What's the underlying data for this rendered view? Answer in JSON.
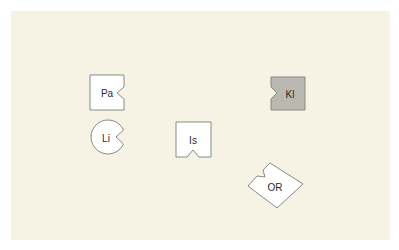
{
  "colors": {
    "background": "#f6f2e4",
    "shape_fill_default": "#ffffff",
    "shape_fill_highlight": "#b9b9b1",
    "stroke": "#8a8a84"
  },
  "shapes": [
    {
      "id": "pa",
      "label": "Pa",
      "shape": "square",
      "notch": "right",
      "highlighted": false
    },
    {
      "id": "li",
      "label": "Li",
      "shape": "circle",
      "notch": "right",
      "highlighted": false
    },
    {
      "id": "is",
      "label": "Is",
      "shape": "square",
      "notch": "bottom",
      "highlighted": false
    },
    {
      "id": "kl",
      "label": "Kl",
      "shape": "square",
      "notch": "left",
      "highlighted": true
    },
    {
      "id": "or",
      "label": "OR",
      "shape": "diamond",
      "notch": "upper-left",
      "highlighted": false
    }
  ]
}
